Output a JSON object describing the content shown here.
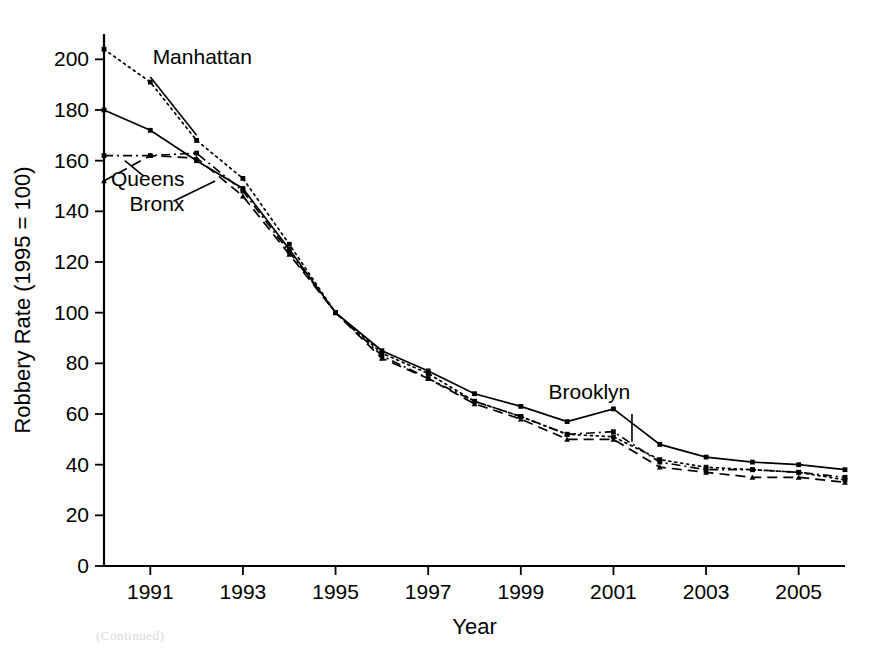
{
  "figure": {
    "background": "#ffffff",
    "ink_color": "#000000",
    "footnote": "(Continued)"
  },
  "chart_data": {
    "type": "line",
    "title": "",
    "xlabel": "Year",
    "ylabel": "Robbery Rate (1995 = 100)",
    "xlim": [
      1990,
      2006
    ],
    "ylim": [
      0,
      210
    ],
    "ytick_values": [
      0,
      20,
      40,
      60,
      80,
      100,
      120,
      140,
      160,
      180,
      200
    ],
    "ytick_labels": [
      "0",
      "20",
      "40",
      "60",
      "80",
      "100",
      "120",
      "140",
      "160",
      "180",
      "200"
    ],
    "xtick_values": [
      1991,
      1993,
      1995,
      1997,
      1999,
      2001,
      2003,
      2005
    ],
    "xtick_labels": [
      "1991",
      "1993",
      "1995",
      "1997",
      "1999",
      "2001",
      "2003",
      "2005"
    ],
    "grid": false,
    "legend": "inline-annotations",
    "x": [
      1990,
      1991,
      1992,
      1993,
      1994,
      1995,
      1996,
      1997,
      1998,
      1999,
      2000,
      2001,
      2002,
      2003,
      2004,
      2005,
      2006
    ],
    "series": [
      {
        "name": "Manhattan",
        "style": "dotted",
        "marker": "square",
        "values": [
          204,
          191,
          168,
          153,
          127,
          100,
          84,
          76,
          65,
          59,
          52,
          51,
          42,
          39,
          38,
          37,
          34
        ],
        "label_x": 1991.05,
        "label_y": 198,
        "leader_from": [
          1991.0,
          193
        ],
        "leader_to": [
          1992.0,
          170
        ]
      },
      {
        "name": "Brooklyn",
        "style": "solid",
        "marker": "square",
        "values": [
          180,
          172,
          160,
          149,
          125,
          100,
          85,
          77,
          68,
          63,
          57,
          62,
          48,
          43,
          41,
          40,
          38
        ],
        "label_x": 1999.6,
        "label_y": 66,
        "leader_from": [
          2001.4,
          60
        ],
        "leader_to": [
          2001.4,
          49
        ]
      },
      {
        "name": "Bronx",
        "style": "dashdot",
        "marker": "square",
        "values": [
          162,
          162,
          163,
          148,
          124,
          100,
          83,
          74,
          65,
          59,
          52,
          53,
          41,
          38,
          38,
          37,
          35
        ],
        "label_x": 1990.55,
        "label_y": 140,
        "leader_from": [
          1991.5,
          144
        ],
        "leader_to": [
          1992.4,
          152
        ]
      },
      {
        "name": "Queens",
        "style": "dashed",
        "marker": "triangle",
        "values": [
          152,
          162,
          161,
          146,
          123,
          100,
          82,
          74,
          64,
          58,
          50,
          50,
          39,
          37,
          35,
          35,
          33
        ],
        "label_x": 1990.15,
        "label_y": 150,
        "leader_from": [
          1990.85,
          154
        ],
        "leader_to": [
          1990.45,
          160
        ]
      }
    ]
  }
}
